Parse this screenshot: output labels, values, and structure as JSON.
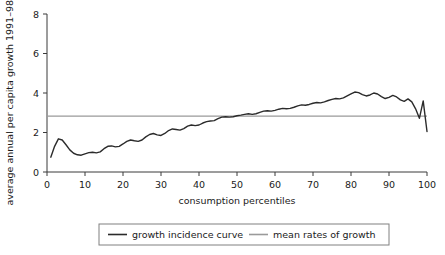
{
  "chart_data": {
    "type": "line",
    "title": "",
    "xlabel": "consumption percentiles",
    "ylabel": "average annual per capita growth 1991–98 (%)",
    "xlim": [
      0,
      100
    ],
    "ylim": [
      0,
      8
    ],
    "xticks": [
      0,
      10,
      20,
      30,
      40,
      50,
      60,
      70,
      80,
      90,
      100
    ],
    "yticks": [
      0,
      2,
      4,
      6,
      8
    ],
    "grid": false,
    "legend_position": "bottom",
    "series": [
      {
        "name": "growth incidence curve",
        "color": "#2b2b2b",
        "x": [
          1,
          2,
          3,
          4,
          5,
          6,
          7,
          8,
          9,
          10,
          11,
          12,
          13,
          14,
          15,
          16,
          17,
          18,
          19,
          20,
          21,
          22,
          23,
          24,
          25,
          26,
          27,
          28,
          29,
          30,
          31,
          32,
          33,
          34,
          35,
          36,
          37,
          38,
          39,
          40,
          41,
          42,
          43,
          44,
          45,
          46,
          47,
          48,
          49,
          50,
          51,
          52,
          53,
          54,
          55,
          56,
          57,
          58,
          59,
          60,
          61,
          62,
          63,
          64,
          65,
          66,
          67,
          68,
          69,
          70,
          71,
          72,
          73,
          74,
          75,
          76,
          77,
          78,
          79,
          80,
          81,
          82,
          83,
          84,
          85,
          86,
          87,
          88,
          89,
          90,
          91,
          92,
          93,
          94,
          95,
          96,
          97,
          98,
          99,
          100
        ],
        "y": [
          0.75,
          1.3,
          1.68,
          1.62,
          1.38,
          1.12,
          0.95,
          0.87,
          0.85,
          0.92,
          0.98,
          1.0,
          0.97,
          1.02,
          1.18,
          1.3,
          1.32,
          1.27,
          1.3,
          1.42,
          1.55,
          1.62,
          1.58,
          1.55,
          1.62,
          1.78,
          1.9,
          1.95,
          1.88,
          1.85,
          1.95,
          2.1,
          2.18,
          2.15,
          2.12,
          2.2,
          2.32,
          2.38,
          2.35,
          2.38,
          2.48,
          2.55,
          2.58,
          2.6,
          2.7,
          2.78,
          2.8,
          2.78,
          2.8,
          2.85,
          2.88,
          2.92,
          2.95,
          2.92,
          2.95,
          3.02,
          3.08,
          3.1,
          3.08,
          3.12,
          3.18,
          3.22,
          3.2,
          3.22,
          3.28,
          3.35,
          3.4,
          3.38,
          3.42,
          3.48,
          3.52,
          3.5,
          3.55,
          3.62,
          3.68,
          3.72,
          3.7,
          3.75,
          3.85,
          3.95,
          4.05,
          4.02,
          3.92,
          3.85,
          3.9,
          4.0,
          3.95,
          3.82,
          3.72,
          3.78,
          3.88,
          3.8,
          3.65,
          3.58,
          3.7,
          3.55,
          3.2,
          2.72,
          3.6,
          2.05
        ]
      },
      {
        "name": "mean rates of growth",
        "color": "#9a9a9a",
        "x": [
          0,
          100
        ],
        "y": [
          2.83,
          2.83
        ]
      }
    ],
    "legend": [
      "growth incidence curve",
      "mean rates of growth"
    ]
  },
  "axes": {
    "y_title": "average annual per capita growth 1991–98 (%)",
    "x_title": "consumption percentiles",
    "y_tick_labels": [
      "0",
      "2",
      "4",
      "6",
      "8"
    ],
    "x_tick_labels": [
      "0",
      "10",
      "20",
      "30",
      "40",
      "50",
      "60",
      "70",
      "80",
      "90",
      "100"
    ]
  },
  "legend": {
    "items": [
      {
        "label": "growth incidence curve",
        "color": "#2b2b2b"
      },
      {
        "label": "mean rates of growth",
        "color": "#9a9a9a"
      }
    ]
  }
}
